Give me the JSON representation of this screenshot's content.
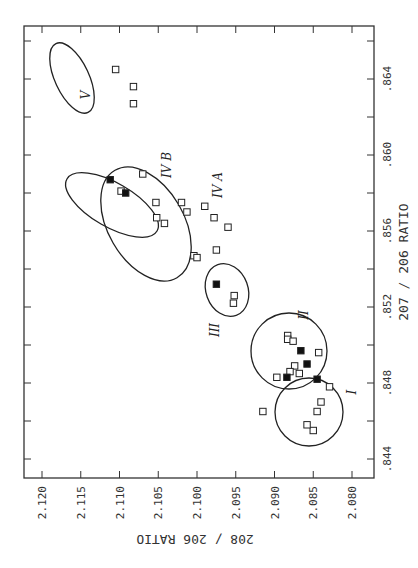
{
  "chart_data": {
    "type": "scatter",
    "orientation": "rotated 90 degrees clockwise on page",
    "title": "",
    "xlabel": "207 / 206 RATIO",
    "ylabel": "208 / 206 RATIO",
    "xlim": [
      0.843,
      0.866
    ],
    "ylim": [
      2.078,
      2.121
    ],
    "x_ticks": [
      ".844",
      ".848",
      ".852",
      ".856",
      ".860",
      ".864"
    ],
    "y_ticks": [
      "2.080",
      "2.085",
      "2.090",
      "2.095",
      "2.100",
      "2.105",
      "2.110",
      "2.115",
      "2.120"
    ],
    "grid": false,
    "legend": null,
    "marker_types": {
      "open": "open square",
      "filled": "filled square"
    },
    "groups": [
      {
        "name": "I",
        "points": [
          {
            "x": 0.8465,
            "y": 2.0845,
            "filled": false
          },
          {
            "x": 0.8455,
            "y": 2.085,
            "filled": false
          },
          {
            "x": 0.847,
            "y": 2.084,
            "filled": false
          },
          {
            "x": 0.8478,
            "y": 2.0829,
            "filled": false
          },
          {
            "x": 0.8458,
            "y": 2.0858,
            "filled": false
          },
          {
            "x": 0.8465,
            "y": 2.0915,
            "filled": false
          }
        ]
      },
      {
        "name": "II",
        "points": [
          {
            "x": 0.8505,
            "y": 2.0883,
            "filled": false
          },
          {
            "x": 0.8503,
            "y": 2.0883,
            "filled": false
          },
          {
            "x": 0.8502,
            "y": 2.0876,
            "filled": false
          },
          {
            "x": 0.8497,
            "y": 2.0866,
            "filled": true
          },
          {
            "x": 0.849,
            "y": 2.0858,
            "filled": true
          },
          {
            "x": 0.8489,
            "y": 2.0874,
            "filled": false
          },
          {
            "x": 0.8486,
            "y": 2.088,
            "filled": false
          },
          {
            "x": 0.8485,
            "y": 2.0868,
            "filled": false
          },
          {
            "x": 0.8483,
            "y": 2.0884,
            "filled": true
          },
          {
            "x": 0.8482,
            "y": 2.0845,
            "filled": true
          },
          {
            "x": 0.8483,
            "y": 2.0897,
            "filled": false
          },
          {
            "x": 0.8496,
            "y": 2.0843,
            "filled": false
          }
        ]
      },
      {
        "name": "III",
        "points": [
          {
            "x": 0.8532,
            "y": 2.0975,
            "filled": true
          },
          {
            "x": 0.8522,
            "y": 2.0953,
            "filled": false
          },
          {
            "x": 0.8526,
            "y": 2.0952,
            "filled": false
          }
        ]
      },
      {
        "name": "IV A",
        "points": [
          {
            "x": 0.8547,
            "y": 2.1004,
            "filled": false
          },
          {
            "x": 0.8546,
            "y": 2.1,
            "filled": false
          },
          {
            "x": 0.8564,
            "y": 2.1042,
            "filled": false
          },
          {
            "x": 0.855,
            "y": 2.0975,
            "filled": false
          },
          {
            "x": 0.8562,
            "y": 2.096,
            "filled": false
          },
          {
            "x": 0.8567,
            "y": 2.0978,
            "filled": false
          },
          {
            "x": 0.8573,
            "y": 2.099,
            "filled": false
          }
        ]
      },
      {
        "name": "IV B",
        "points": [
          {
            "x": 0.8587,
            "y": 2.1112,
            "filled": true
          },
          {
            "x": 0.8581,
            "y": 2.1098,
            "filled": false
          },
          {
            "x": 0.858,
            "y": 2.1092,
            "filled": true
          },
          {
            "x": 0.859,
            "y": 2.107,
            "filled": false
          },
          {
            "x": 0.8575,
            "y": 2.1053,
            "filled": false
          },
          {
            "x": 0.8567,
            "y": 2.1052,
            "filled": false
          },
          {
            "x": 0.8575,
            "y": 2.102,
            "filled": false
          },
          {
            "x": 0.857,
            "y": 2.1013,
            "filled": false
          }
        ]
      },
      {
        "name": "V",
        "points": [
          {
            "x": 0.8645,
            "y": 2.1105,
            "filled": false
          },
          {
            "x": 0.8636,
            "y": 2.1082,
            "filled": false
          },
          {
            "x": 0.8627,
            "y": 2.1082,
            "filled": false
          }
        ]
      }
    ]
  },
  "labels": {
    "xlabel": "207 / 206 RATIO",
    "ylabel": "208 / 206 RATIO",
    "x_ticks": [
      ".844",
      ".848",
      ".852",
      ".856",
      ".860",
      ".864"
    ],
    "y_ticks": [
      "2.120",
      "2.115",
      "2.110",
      "2.105",
      "2.100",
      "2.095",
      "2.090",
      "2.085",
      "2.080"
    ],
    "groups": [
      "I",
      "II",
      "III",
      "IV A",
      "IV B",
      "V"
    ]
  }
}
